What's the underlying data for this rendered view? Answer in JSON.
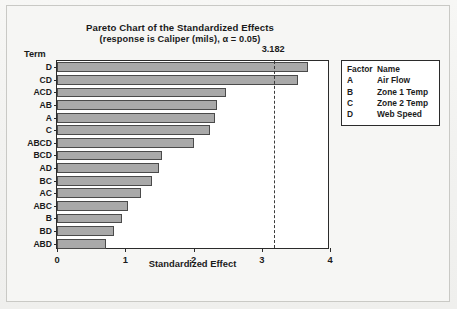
{
  "chart_data": {
    "type": "bar",
    "orientation": "horizontal",
    "title": "Pareto Chart of the Standardized Effects",
    "subtitle": "(response is Caliper (mils), α = 0.05)",
    "xlabel": "Standardized Effect",
    "ylabel": "Term",
    "xlim": [
      0,
      4
    ],
    "xticks": [
      0,
      1,
      2,
      3,
      4
    ],
    "xtick_labels": [
      "0",
      "1",
      "2",
      "3",
      "4"
    ],
    "grid": false,
    "legend_position": "right",
    "categories": [
      "D",
      "CD",
      "ACD",
      "AB",
      "A",
      "C",
      "ABCD",
      "BCD",
      "AD",
      "BC",
      "AC",
      "ABC",
      "B",
      "BD",
      "ABD"
    ],
    "values": [
      3.68,
      3.53,
      2.48,
      2.35,
      2.32,
      2.24,
      2.01,
      1.54,
      1.5,
      1.39,
      1.23,
      1.04,
      0.95,
      0.84,
      0.72
    ],
    "annotations": [
      {
        "name": "critical-value",
        "label": "3.182",
        "value": 3.182,
        "style": "dashed-vertical-line"
      }
    ],
    "legend": {
      "headers": [
        "Factor",
        "Name"
      ],
      "entries": [
        {
          "code": "A",
          "name": "Air Flow"
        },
        {
          "code": "B",
          "name": "Zone 1 Temp"
        },
        {
          "code": "C",
          "name": "Zone 2 Temp"
        },
        {
          "code": "D",
          "name": "Web Speed"
        }
      ]
    },
    "colors": {
      "bar_fill": "#a9a9a9",
      "bar_edge": "#4a4a4a",
      "axis": "#2b2b2b",
      "reference_line": "#3a3a3a",
      "plot_background": "#ffffff",
      "page_background": "#f3f3f1",
      "text": "#1b1b1b"
    }
  }
}
